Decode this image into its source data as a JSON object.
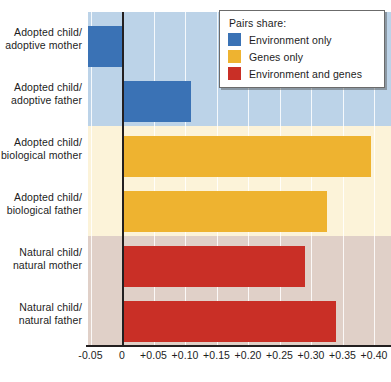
{
  "chart_data": {
    "type": "bar",
    "orientation": "horizontal",
    "title": "",
    "xlabel": "",
    "ylabel": "",
    "xlim": [
      -0.075,
      0.405
    ],
    "grid": true,
    "legend_position": "top-right",
    "categories": [
      "Adopted child/ adoptive mother",
      "Adopted child/ adoptive father",
      "Adopted child/ biological mother",
      "Adopted child/ biological father",
      "Natural child/ natural mother",
      "Natural child/ natural father"
    ],
    "category_lines": [
      [
        "Adopted child/",
        "adoptive mother"
      ],
      [
        "Adopted child/",
        "adoptive father"
      ],
      [
        "Adopted child/",
        "biological mother"
      ],
      [
        "Adopted child/",
        "biological father"
      ],
      [
        "Natural child/",
        "natural mother"
      ],
      [
        "Natural child/",
        "natural father"
      ]
    ],
    "values": [
      -0.055,
      0.11,
      0.395,
      0.325,
      0.29,
      0.34
    ],
    "bar_groups": [
      "Environment only",
      "Environment only",
      "Genes only",
      "Genes only",
      "Environment and genes",
      "Environment and genes"
    ],
    "tick_values": [
      -0.05,
      0,
      0.05,
      0.1,
      0.15,
      0.2,
      0.25,
      0.3,
      0.35,
      0.4
    ],
    "tick_labels": [
      "-0.05",
      "0",
      "+0.05",
      "+0.10",
      "+0.15",
      "+0.20",
      "+0.25",
      "+0.30",
      "+0.35",
      "+0.40"
    ],
    "band_labels": [
      "Environment only",
      "Genes only",
      "Environment and genes"
    ],
    "colors": {
      "environment_only": "#3a72b5",
      "genes_only": "#eeb330",
      "environment_and_genes": "#c92f26",
      "band_environment_only": "#bcd3e8",
      "band_genes_only": "#fcf3d9",
      "band_environment_and_genes": "#e0d0c8",
      "axis": "#231f20",
      "gridline": "#ffffff"
    }
  },
  "legend": {
    "title": "Pairs share:",
    "entries": [
      {
        "label": "Environment only",
        "color": "#3a72b5"
      },
      {
        "label": "Genes only",
        "color": "#eeb330"
      },
      {
        "label": "Environment and genes",
        "color": "#c92f26"
      }
    ]
  }
}
